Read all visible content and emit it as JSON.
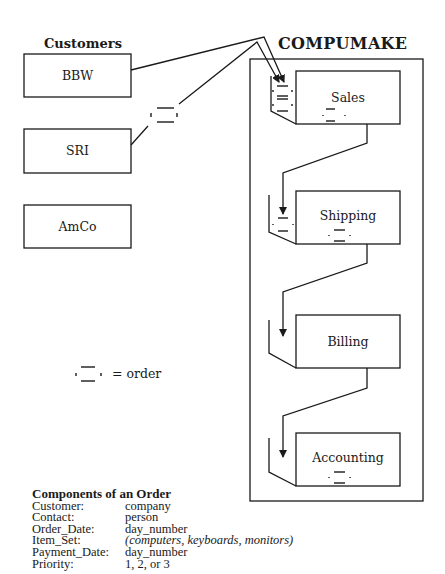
{
  "customers": {
    "heading": "Customers",
    "items": [
      {
        "label": "BBW"
      },
      {
        "label": "SRI"
      },
      {
        "label": "AmCo"
      }
    ]
  },
  "company": {
    "heading": "COMPUMAKE",
    "departments": [
      {
        "label": "Sales"
      },
      {
        "label": "Shipping"
      },
      {
        "label": "Billing"
      },
      {
        "label": "Accounting"
      }
    ]
  },
  "legend": {
    "icon": "order-icon",
    "text": "= order"
  },
  "components": {
    "title": "Components of an Order",
    "rows": [
      {
        "key": "Customer:",
        "value": "company",
        "italic": false
      },
      {
        "key": "Contact:",
        "value": "person",
        "italic": false
      },
      {
        "key": "Order_Date:",
        "value": "day_number",
        "italic": false
      },
      {
        "key": "Item_Set:",
        "value": "(computers, keyboards, monitors)",
        "italic": true
      },
      {
        "key": "Payment_Date:",
        "value": "day_number",
        "italic": false
      },
      {
        "key": "Priority:",
        "value": "1, 2, or 3",
        "italic": false
      }
    ]
  },
  "colors": {
    "stroke": "#1a1a1a",
    "background": "#ffffff"
  }
}
